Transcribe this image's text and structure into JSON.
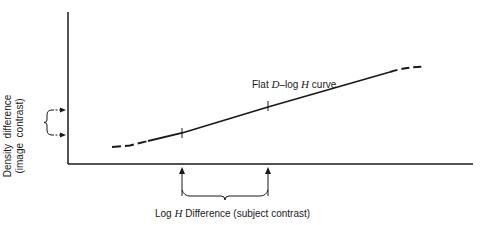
{
  "diagram": {
    "curve_label": {
      "prefix": "Flat ",
      "var1": "D",
      "mid": "–log ",
      "var2": "H",
      "suffix": " curve"
    },
    "x_label": {
      "prefix": "Log ",
      "var": "H",
      "suffix": " Difference (subject contrast)"
    },
    "y_label": {
      "line1": "Density  difference",
      "line2": "(image  contrast)"
    },
    "colors": {
      "ink": "#1a1a1a",
      "background": "#ffffff"
    }
  }
}
